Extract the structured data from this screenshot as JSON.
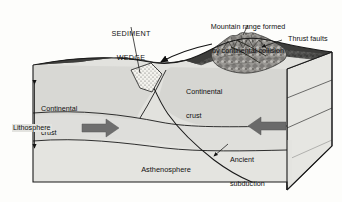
{
  "figure": {
    "type": "geologic-block-diagram",
    "background_color": "#fdfdfb",
    "line_color": "#1a1a1a",
    "crust_fill": "#d8d8d4",
    "mantle_fill": "#e2e2de",
    "terrain_fill": "#4e4e4c",
    "arrow_fill": "#6e6e6e",
    "wedge_fill": "#f2f1ec"
  },
  "labels": {
    "sediment_wedge": {
      "line1": "SEDIMENT",
      "line2": "WEDGE"
    },
    "mountain_range": {
      "line1": "Mountain range formed",
      "line2": "by continental collision"
    },
    "thrust_faults": "Thrust faults",
    "continental_crust_right": {
      "line1": "Continental",
      "line2": "crust"
    },
    "continental_crust_left": {
      "line1": "Continental",
      "line2": "crust"
    },
    "lithosphere": "Lithosphere",
    "ancient_subduction_zone": {
      "line1": "Ancient",
      "line2": "subduction",
      "line3": "zone"
    },
    "asthenosphere": "Asthenosphere"
  },
  "annotations": {
    "convergence_arrow_left": "right-pointing-arrow",
    "convergence_arrow_right": "left-pointing-arrow",
    "lithosphere_extent_arrow": "vertical-double-headed-arrow",
    "collision_motion_arrow": "curved-arrow-down-left"
  }
}
